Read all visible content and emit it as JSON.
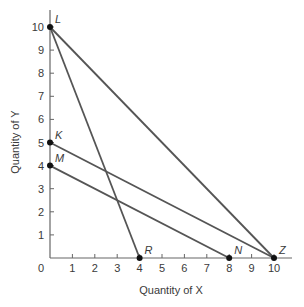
{
  "chart_data": {
    "type": "line",
    "title": "",
    "xlabel": "Quantity of X",
    "ylabel": "Quantity of Y",
    "xlim": [
      0,
      10
    ],
    "ylim": [
      0,
      10
    ],
    "grid": false,
    "legend": null,
    "x_ticks": [
      1,
      2,
      3,
      4,
      5,
      6,
      7,
      8,
      9,
      10
    ],
    "y_ticks": [
      1,
      2,
      3,
      4,
      5,
      6,
      7,
      8,
      9,
      10
    ],
    "origin_label": "0",
    "points": [
      {
        "label": "L",
        "x": 0,
        "y": 10
      },
      {
        "label": "K",
        "x": 0,
        "y": 5
      },
      {
        "label": "M",
        "x": 0,
        "y": 4
      },
      {
        "label": "R",
        "x": 4,
        "y": 0
      },
      {
        "label": "N",
        "x": 8,
        "y": 0
      },
      {
        "label": "Z",
        "x": 10,
        "y": 0
      }
    ],
    "series": [
      {
        "name": "LR",
        "x": [
          0,
          4
        ],
        "y": [
          10,
          0
        ]
      },
      {
        "name": "LZ",
        "x": [
          0,
          10
        ],
        "y": [
          10,
          0
        ]
      },
      {
        "name": "KZ",
        "x": [
          0,
          10
        ],
        "y": [
          5,
          0
        ]
      },
      {
        "name": "MN",
        "x": [
          0,
          8
        ],
        "y": [
          4,
          0
        ]
      }
    ],
    "colors": {
      "line": "#555555",
      "axis": "#666666",
      "point": "#111111"
    }
  }
}
